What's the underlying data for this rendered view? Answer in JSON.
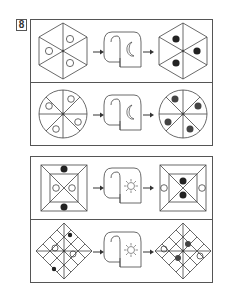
{
  "puzzle": {
    "number": "8",
    "groups": [
      {
        "transform_icon": "moon-scroll-icon",
        "rows": [
          {
            "shape": "hexagon",
            "segments": 6,
            "before": {
              "open_circles": 3,
              "filled_circles": 0
            },
            "after": {
              "open_circles": 0,
              "filled_circles": 3
            }
          },
          {
            "shape": "circle",
            "segments": 8,
            "before": {
              "open_circles": 4,
              "filled_circles": 0
            },
            "after": {
              "open_circles": 0,
              "filled_circles": 4
            }
          }
        ]
      },
      {
        "transform_icon": "sun-scroll-icon",
        "rows": [
          {
            "shape": "square",
            "segments": 8,
            "before": {
              "open_circles": 2,
              "filled_circles": 2
            },
            "after": {
              "open_circles": 2,
              "filled_circles": 2
            }
          },
          {
            "shape": "diamond",
            "segments": 16,
            "before": {
              "open_circles": 2,
              "filled_circles": 2
            },
            "after": {
              "open_circles": 2,
              "filled_circles": 2
            }
          }
        ]
      }
    ]
  },
  "colors": {
    "line": "#444444",
    "frame": "#555555",
    "filled_dot": "#222222",
    "filled_dot_gray": "#444444",
    "background": "#ffffff"
  }
}
